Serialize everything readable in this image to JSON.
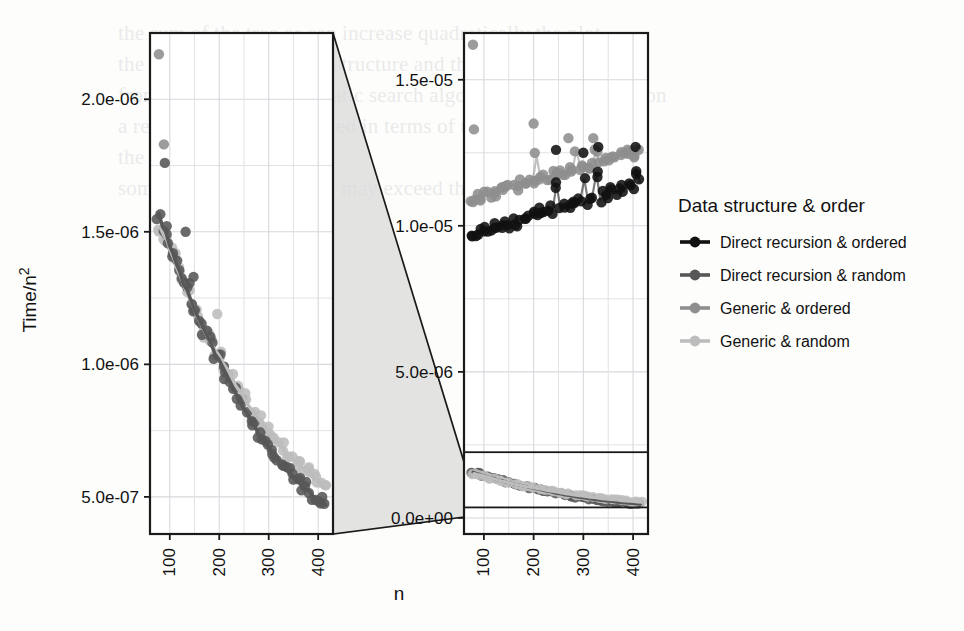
{
  "figure": {
    "xlabel": "n",
    "ylabel_prefix": "Time/n",
    "ylabel_exponent": "2"
  },
  "legend": {
    "title": "Data structure & order",
    "entries": [
      {
        "label": "Direct recursion & ordered",
        "color": "#111111"
      },
      {
        "label": "Direct recursion & random",
        "color": "#575757"
      },
      {
        "label": "Generic & ordered",
        "color": "#8e8e8e"
      },
      {
        "label": "Generic & random",
        "color": "#bdbdbd"
      }
    ]
  },
  "panels": {
    "left": {
      "name": "zoomed-detail-panel",
      "ytick_labels": [
        "5.0e-07",
        "1.0e-06",
        "1.5e-06",
        "2.0e-06"
      ],
      "ytick_values": [
        5e-07,
        1e-06,
        1.5e-06,
        2e-06
      ],
      "xtick_labels": [
        "100",
        "200",
        "300",
        "400"
      ],
      "xtick_values": [
        100,
        200,
        300,
        400
      ],
      "ylim": [
        3.6e-07,
        2.25e-06
      ],
      "xlim": [
        60,
        430
      ]
    },
    "right": {
      "name": "full-range-panel",
      "ytick_labels": [
        "0.0e+00",
        "5.0e-06",
        "1.0e-05",
        "1.5e-05"
      ],
      "ytick_values": [
        0.0,
        5e-06,
        1e-05,
        1.5e-05
      ],
      "xtick_labels": [
        "100",
        "200",
        "300",
        "400"
      ],
      "xtick_values": [
        100,
        200,
        300,
        400
      ],
      "ylim": [
        -5.5e-07,
        1.66e-05
      ],
      "xlim": [
        60,
        430
      ],
      "inset_highlight": {
        "ymin": 3.6e-07,
        "ymax": 2.25e-06
      }
    }
  },
  "chart_data": {
    "type": "scatter",
    "title": "",
    "xlabel": "n",
    "ylabel": "Time/n^2",
    "legend_title": "Data structure & order",
    "legend_position": "right",
    "grid": true,
    "panels": [
      "zoomed detail (Time/n^2 from 5.0e-07 to 2.0e-06)",
      "full range (Time/n^2 from 0.0e+00 to 1.5e-05)"
    ],
    "series": [
      {
        "name": "Direct recursion & ordered",
        "color": "#111111",
        "panel": "right",
        "note": "flat band near 1.0e-05, slowly rising with n",
        "x": [
          75,
          82,
          90,
          97,
          104,
          112,
          119,
          127,
          134,
          142,
          150,
          158,
          166,
          174,
          182,
          190,
          198,
          206,
          214,
          222,
          230,
          238,
          246,
          254,
          262,
          270,
          278,
          286,
          294,
          302,
          310,
          318,
          326,
          334,
          342,
          350,
          358,
          366,
          374,
          382,
          390,
          398,
          406,
          414
        ],
        "y": [
          9.6e-06,
          9.7e-06,
          9.8e-06,
          9.75e-06,
          9.9e-06,
          9.85e-06,
          1e-05,
          9.95e-06,
          1e-05,
          1.01e-05,
          1e-05,
          1.02e-05,
          1.01e-05,
          1.03e-05,
          1.02e-05,
          1.03e-05,
          1.04e-05,
          1.03e-05,
          1.05e-05,
          1.04e-05,
          1.06e-05,
          1.05e-05,
          1.14e-05,
          1.06e-05,
          1.07e-05,
          1.06e-05,
          1.08e-05,
          1.07e-05,
          1.09e-05,
          1.16e-05,
          1.08e-05,
          1.1e-05,
          1.18e-05,
          1.09e-05,
          1.11e-05,
          1.1e-05,
          1.12e-05,
          1.11e-05,
          1.13e-05,
          1.12e-05,
          1.14e-05,
          1.13e-05,
          1.19e-05,
          1.15e-05
        ]
      },
      {
        "name": "Direct recursion & random",
        "color": "#575757",
        "panel": "left",
        "note": "decaying curve from ~1.55e-06 at n=80 to ~4.6e-07 at n=410",
        "x": [
          78,
          85,
          92,
          99,
          106,
          113,
          120,
          128,
          135,
          143,
          151,
          159,
          167,
          175,
          183,
          191,
          199,
          207,
          215,
          223,
          231,
          239,
          247,
          255,
          263,
          271,
          279,
          287,
          295,
          303,
          311,
          319,
          327,
          335,
          343,
          351,
          359,
          367,
          375,
          383,
          391,
          399,
          407,
          415
        ],
        "y": [
          1.57e-06,
          1.52e-06,
          1.5e-06,
          1.45e-06,
          1.42e-06,
          1.38e-06,
          1.35e-06,
          1.3e-06,
          1.28e-06,
          1.24e-06,
          1.2e-06,
          1.17e-06,
          1.14e-06,
          1.11e-06,
          1.08e-06,
          1.04e-06,
          1.02e-06,
          9.9e-07,
          9.6e-07,
          9.3e-07,
          9e-07,
          8.7e-07,
          8.4e-07,
          8.2e-07,
          7.9e-07,
          7.7e-07,
          7.4e-07,
          7.2e-07,
          7e-07,
          6.8e-07,
          6.6e-07,
          6.4e-07,
          6.2e-07,
          6e-07,
          5.9e-07,
          5.7e-07,
          5.6e-07,
          5.4e-07,
          5.3e-07,
          5.2e-07,
          5e-07,
          4.9e-07,
          4.8e-07,
          4.7e-07
        ]
      },
      {
        "name": "Generic & ordered",
        "color": "#8e8e8e",
        "panel": "right",
        "note": "flat band near 1.15e-05, slightly above black band",
        "x": [
          75,
          82,
          90,
          97,
          104,
          112,
          119,
          127,
          134,
          142,
          150,
          158,
          166,
          174,
          182,
          190,
          198,
          206,
          214,
          222,
          230,
          238,
          246,
          254,
          262,
          270,
          278,
          286,
          294,
          302,
          310,
          318,
          326,
          334,
          342,
          350,
          358,
          366,
          374,
          382,
          390,
          398,
          406,
          414
        ],
        "y": [
          1.08e-05,
          1.09e-05,
          1.1e-05,
          1.09e-05,
          1.11e-05,
          1.1e-05,
          1.12e-05,
          1.11e-05,
          1.13e-05,
          1.12e-05,
          1.13e-05,
          1.14e-05,
          1.13e-05,
          1.15e-05,
          1.14e-05,
          1.16e-05,
          1.15e-05,
          1.24e-05,
          1.16e-05,
          1.17e-05,
          1.16e-05,
          1.18e-05,
          1.17e-05,
          1.19e-05,
          1.18e-05,
          1.2e-05,
          1.19e-05,
          1.26e-05,
          1.2e-05,
          1.21e-05,
          1.2e-05,
          1.22e-05,
          1.25e-05,
          1.21e-05,
          1.23e-05,
          1.22e-05,
          1.24e-05,
          1.23e-05,
          1.25e-05,
          1.24e-05,
          1.26e-05,
          1.25e-05,
          1.24e-05,
          1.26e-05
        ]
      },
      {
        "name": "Generic & random",
        "color": "#bdbdbd",
        "panel": "left",
        "note": "decaying curve overlapping dark gray, slightly higher at large n",
        "x": [
          80,
          87,
          94,
          101,
          108,
          115,
          122,
          130,
          137,
          145,
          153,
          161,
          169,
          177,
          185,
          193,
          201,
          209,
          217,
          225,
          233,
          241,
          249,
          257,
          265,
          273,
          281,
          289,
          297,
          305,
          313,
          321,
          329,
          337,
          345,
          353,
          361,
          369,
          377,
          385,
          393,
          401,
          409,
          417
        ],
        "y": [
          1.52e-06,
          1.49e-06,
          1.47e-06,
          1.43e-06,
          1.4e-06,
          1.36e-06,
          1.33e-06,
          1.29e-06,
          1.26e-06,
          1.23e-06,
          1.19e-06,
          1.16e-06,
          1.13e-06,
          1.1e-06,
          1.07e-06,
          1.05e-06,
          1.03e-06,
          1e-06,
          9.8e-07,
          9.5e-07,
          9.2e-07,
          9e-07,
          8.8e-07,
          8.5e-07,
          8.3e-07,
          8.1e-07,
          7.9e-07,
          7.7e-07,
          7.5e-07,
          7.3e-07,
          7.1e-07,
          7e-07,
          6.8e-07,
          6.6e-07,
          6.5e-07,
          6.3e-07,
          6.2e-07,
          6.1e-07,
          5.9e-07,
          5.8e-07,
          5.7e-07,
          5.6e-07,
          5.5e-07,
          5.4e-07
        ]
      }
    ],
    "outliers_left": [
      {
        "x": 78,
        "y": 2.17e-06,
        "color": "#8e8e8e"
      },
      {
        "x": 88,
        "y": 1.83e-06,
        "color": "#8e8e8e"
      },
      {
        "x": 90,
        "y": 1.76e-06,
        "color": "#575757"
      },
      {
        "x": 132,
        "y": 1.5e-06,
        "color": "#575757"
      },
      {
        "x": 148,
        "y": 1.33e-06,
        "color": "#575757"
      },
      {
        "x": 196,
        "y": 1.19e-06,
        "color": "#bdbdbd"
      }
    ],
    "outliers_right": [
      {
        "x": 78,
        "y": 1.62e-05,
        "color": "#8e8e8e"
      },
      {
        "x": 80,
        "y": 1.33e-05,
        "color": "#8e8e8e"
      },
      {
        "x": 200,
        "y": 1.35e-05,
        "color": "#8e8e8e"
      },
      {
        "x": 270,
        "y": 1.3e-05,
        "color": "#8e8e8e"
      },
      {
        "x": 320,
        "y": 1.3e-05,
        "color": "#8e8e8e"
      },
      {
        "x": 245,
        "y": 1.26e-05,
        "color": "#111111"
      },
      {
        "x": 300,
        "y": 1.25e-05,
        "color": "#111111"
      },
      {
        "x": 330,
        "y": 1.27e-05,
        "color": "#111111"
      },
      {
        "x": 405,
        "y": 1.27e-05,
        "color": "#111111"
      }
    ]
  },
  "bleed_text": [
    {
      "x": 118,
      "y": 18,
      "t": "the sum of the tree or can increase quadratically the plot"
    },
    {
      "x": 118,
      "y": 49,
      "t": "the new class in the data structure and the following index"
    },
    {
      "x": 118,
      "y": 80,
      "t": "from the scale of a quadratic search algorithm applied recursion"
    },
    {
      "x": 118,
      "y": 111,
      "t": "a recursion that can be used in terms of the parametrised data"
    },
    {
      "x": 118,
      "y": 142,
      "t": "the parameter n"
    },
    {
      "x": 118,
      "y": 173,
      "t": "some other recursion that may exceed the one in the list"
    }
  ]
}
